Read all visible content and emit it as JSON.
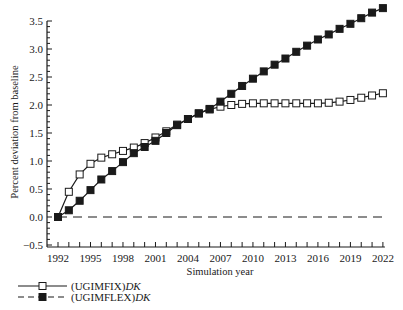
{
  "chart_data": {
    "type": "line",
    "title": "",
    "xlabel": "Simulation year",
    "ylabel": "Percent deviation from baseline",
    "xlim": [
      1991,
      2023
    ],
    "ylim": [
      -0.5,
      3.5
    ],
    "grid": false,
    "legend_position": "bottom-left, below x-axis",
    "x_ticks": [
      1992,
      1995,
      1998,
      2001,
      2004,
      2007,
      2010,
      2013,
      2016,
      2019,
      2022
    ],
    "x_tick_labels": [
      "1992",
      "1995",
      "1998",
      "2001",
      "2004",
      "2007",
      "2010",
      "2013",
      "2016",
      "2019",
      "2022"
    ],
    "y_ticks": [
      -0.5,
      0.0,
      0.5,
      1.0,
      1.5,
      2.0,
      2.5,
      3.0,
      3.5
    ],
    "y_tick_labels": [
      "−0.5",
      "0.0",
      "0.5",
      "1.0",
      "1.5",
      "2.0",
      "2.5",
      "3.0",
      "3.5"
    ],
    "x": [
      1992,
      1993,
      1994,
      1995,
      1996,
      1997,
      1998,
      1999,
      2000,
      2001,
      2002,
      2003,
      2004,
      2005,
      2006,
      2007,
      2008,
      2009,
      2010,
      2011,
      2012,
      2013,
      2014,
      2015,
      2016,
      2017,
      2018,
      2019,
      2020,
      2021,
      2022
    ],
    "series": [
      {
        "name": "(UGIMFIX)DK",
        "legend_prefix": "(UGIMFIX)",
        "legend_italic": "DK",
        "line_style": "solid",
        "marker": "open-square",
        "values": [
          0.0,
          0.45,
          0.76,
          0.95,
          1.06,
          1.12,
          1.18,
          1.24,
          1.32,
          1.42,
          1.53,
          1.65,
          1.75,
          1.85,
          1.92,
          1.97,
          2.0,
          2.02,
          2.03,
          2.03,
          2.03,
          2.03,
          2.03,
          2.03,
          2.03,
          2.04,
          2.06,
          2.09,
          2.13,
          2.17,
          2.21
        ]
      },
      {
        "name": "(UGIMFLEX)DK",
        "legend_prefix": "(UGIMFLEX)",
        "legend_italic": "DK",
        "line_style": "dashed",
        "marker": "filled-square",
        "values": [
          0.0,
          0.12,
          0.29,
          0.48,
          0.67,
          0.82,
          0.98,
          1.14,
          1.25,
          1.36,
          1.5,
          1.64,
          1.75,
          1.85,
          1.93,
          2.06,
          2.2,
          2.34,
          2.47,
          2.6,
          2.72,
          2.83,
          2.95,
          3.06,
          3.17,
          3.26,
          3.36,
          3.45,
          3.55,
          3.65,
          3.73
        ]
      },
      {
        "name": "baseline",
        "line_style": "dashed",
        "marker": "none",
        "values": [
          0.0,
          0.0,
          0.0,
          0.0,
          0.0,
          0.0,
          0.0,
          0.0,
          0.0,
          0.0,
          0.0,
          0.0,
          0.0,
          0.0,
          0.0,
          0.0,
          0.0,
          0.0,
          0.0,
          0.0,
          0.0,
          0.0,
          0.0,
          0.0,
          0.0,
          0.0,
          0.0,
          0.0,
          0.0,
          0.0,
          0.0
        ]
      }
    ]
  },
  "colors": {
    "ink": "#1a1a1a",
    "background": "#ffffff"
  }
}
